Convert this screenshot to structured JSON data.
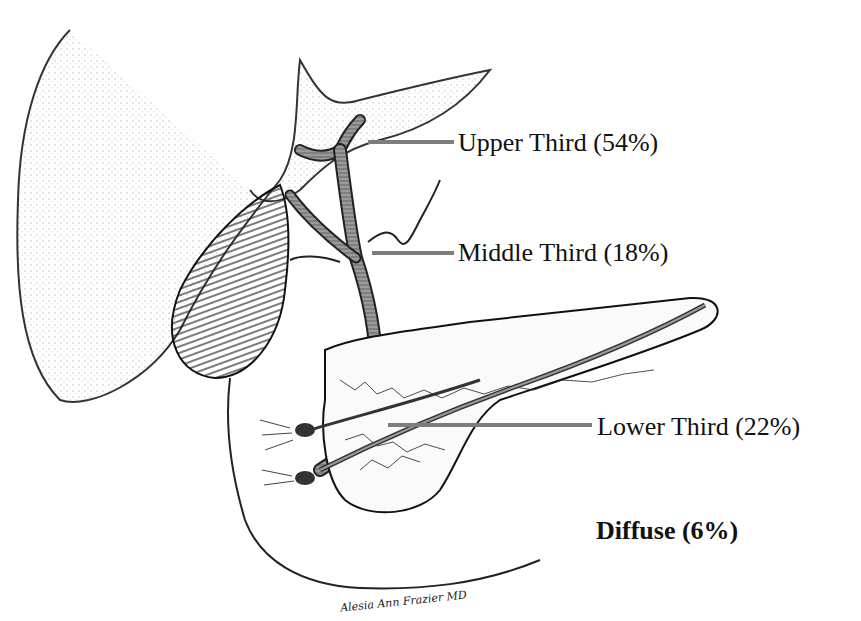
{
  "figure": {
    "labels": [
      {
        "id": "upper",
        "text": "Upper Third (54%)"
      },
      {
        "id": "middle",
        "text": "Middle Third (18%)"
      },
      {
        "id": "lower",
        "text": "Lower Third (22%)"
      },
      {
        "id": "diffuse",
        "text": "Diffuse (6%)"
      }
    ],
    "signature": "Alesia Ann Frazier MD",
    "colors": {
      "ink": "#111111",
      "leader": "#7d7d7d",
      "duct": "#8a8a8a",
      "stipple": "#555555"
    }
  }
}
